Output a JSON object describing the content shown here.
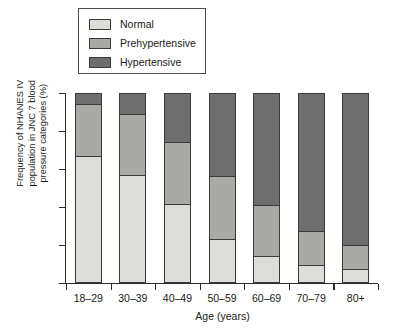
{
  "legend": {
    "items": [
      {
        "label": "Normal",
        "color": "#dcdcd8"
      },
      {
        "label": "Prehypertensive",
        "color": "#a9a9a6"
      },
      {
        "label": "Hypertensive",
        "color": "#6e6e6e"
      }
    ]
  },
  "axes": {
    "ylabel": "Frequency of NHANES IV\npopulation in JNC 7 blood\npressure categories (%)",
    "xlabel": "Age (years)"
  },
  "chart_data": {
    "type": "bar",
    "stacked": true,
    "title": "",
    "xlabel": "Age (years)",
    "ylabel": "Frequency of NHANES IV population in JNC 7 blood pressure categories (%)",
    "ylim": [
      0,
      100
    ],
    "grid": false,
    "legend_position": "top-left",
    "categories": [
      "18–29",
      "30–39",
      "40–49",
      "50–59",
      "60–69",
      "70–79",
      "80+"
    ],
    "series": [
      {
        "name": "Normal",
        "color": "#dcdcd8",
        "values": [
          66.3,
          56.3,
          41.0,
          22.6,
          13.2,
          8.4,
          6.3
        ]
      },
      {
        "name": "Prehypertensive",
        "color": "#a9a9a6",
        "values": [
          27.9,
          32.6,
          32.6,
          33.2,
          27.4,
          18.4,
          12.6
        ]
      },
      {
        "name": "Hypertensive",
        "color": "#6e6e6e",
        "values": [
          5.8,
          11.0,
          26.3,
          44.2,
          59.5,
          73.2,
          81.0
        ]
      }
    ]
  }
}
